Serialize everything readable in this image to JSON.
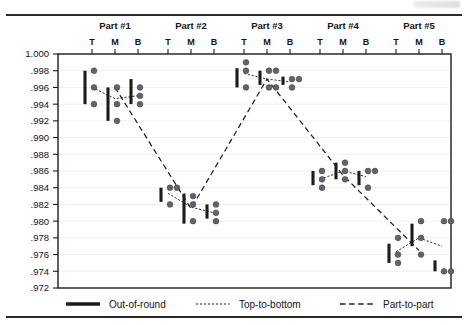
{
  "chart_data": {
    "type": "scatter",
    "title": "",
    "xlabel": "",
    "ylabel": "",
    "ylim": [
      0.972,
      1.0
    ],
    "ytick_step": 0.002,
    "grid": true,
    "ytick_labels": [
      "1.000",
      ".998",
      ".996",
      ".994",
      ".992",
      ".990",
      ".988",
      ".986",
      ".984",
      ".982",
      ".980",
      ".978",
      ".976",
      ".974",
      ".972"
    ],
    "ytick_values": [
      1.0,
      0.998,
      0.996,
      0.994,
      0.992,
      0.99,
      0.988,
      0.986,
      0.984,
      0.982,
      0.98,
      0.978,
      0.976,
      0.974,
      0.972
    ],
    "position_labels": [
      "T",
      "M",
      "B"
    ],
    "legend": {
      "position": "below-axes",
      "entries": [
        {
          "label": "Out-of-round",
          "style": "thick-solid"
        },
        {
          "label": "Top-to-bottom",
          "style": "fine-dotted"
        },
        {
          "label": "Part-to-part",
          "style": "dashed"
        }
      ]
    },
    "categories": [
      "Part #1",
      "Part #2",
      "Part #3",
      "Part #4",
      "Part #5"
    ],
    "series": [
      {
        "name": "Part #1",
        "positions": [
          {
            "pos": "T",
            "values": [
              0.998,
              0.996,
              0.994
            ],
            "range": [
              0.994,
              0.998
            ],
            "mean": 0.996
          },
          {
            "pos": "M",
            "values": [
              0.996,
              0.994,
              0.992
            ],
            "range": [
              0.992,
              0.996
            ],
            "mean": 0.99467
          },
          {
            "pos": "B",
            "values": [
              0.996,
              0.995,
              0.994
            ],
            "range": [
              0.994,
              0.997
            ],
            "mean": 0.995
          }
        ]
      },
      {
        "name": "Part #2",
        "positions": [
          {
            "pos": "T",
            "values": [
              0.984,
              0.984,
              0.982
            ],
            "range": [
              0.9823,
              0.984
            ],
            "mean": 0.98333
          },
          {
            "pos": "M",
            "values": [
              0.983,
              0.982,
              0.98
            ],
            "range": [
              0.9797,
              0.9833
            ],
            "mean": 0.98167
          },
          {
            "pos": "B",
            "values": [
              0.982,
              0.981,
              0.98
            ],
            "range": [
              0.9803,
              0.982
            ],
            "mean": 0.981
          }
        ]
      },
      {
        "name": "Part #3",
        "positions": [
          {
            "pos": "T",
            "values": [
              0.999,
              0.998,
              0.996
            ],
            "range": [
              0.996,
              0.9983
            ],
            "mean": 0.99767
          },
          {
            "pos": "M",
            "values": [
              0.998,
              0.998,
              0.996,
              0.996
            ],
            "range": [
              0.9963,
              0.998
            ],
            "mean": 0.997
          },
          {
            "pos": "B",
            "values": [
              0.997,
              0.997,
              0.996
            ],
            "range": [
              0.9963,
              0.9973
            ],
            "mean": 0.99667
          }
        ]
      },
      {
        "name": "Part #4",
        "positions": [
          {
            "pos": "T",
            "values": [
              0.986,
              0.985,
              0.984
            ],
            "range": [
              0.9843,
              0.986
            ],
            "mean": 0.985
          },
          {
            "pos": "M",
            "values": [
              0.987,
              0.986,
              0.985
            ],
            "range": [
              0.985,
              0.987
            ],
            "mean": 0.986
          },
          {
            "pos": "B",
            "values": [
              0.986,
              0.986,
              0.984
            ],
            "range": [
              0.9843,
              0.986
            ],
            "mean": 0.98533
          }
        ]
      },
      {
        "name": "Part #5",
        "positions": [
          {
            "pos": "T",
            "values": [
              0.978,
              0.976,
              0.975
            ],
            "range": [
              0.975,
              0.9773
            ],
            "mean": 0.97633
          },
          {
            "pos": "M",
            "values": [
              0.98,
              0.978,
              0.976
            ],
            "range": [
              0.977,
              0.9797
            ],
            "mean": 0.978
          },
          {
            "pos": "B",
            "values": [
              0.98,
              0.98,
              0.974,
              0.974
            ],
            "range": [
              0.974,
              0.9753
            ],
            "mean": 0.977
          }
        ]
      }
    ],
    "part_to_part_line": [
      0.996,
      0.9815,
      0.997,
      0.9855,
      0.9765
    ]
  }
}
